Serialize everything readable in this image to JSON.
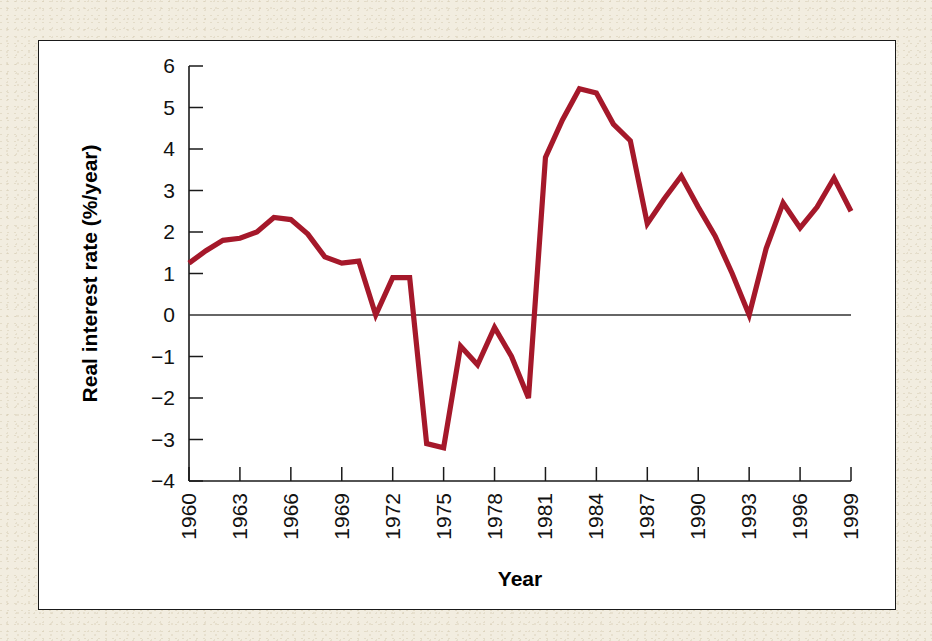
{
  "figure": {
    "page_background": "#F2EDE0",
    "panel_background": "#FFFFFF",
    "panel_border_color": "#1A1A1A"
  },
  "chart_data": {
    "type": "line",
    "title": "",
    "xlabel": "Year",
    "ylabel": "Real interest rate (%/year)",
    "xlim": [
      1960,
      1999
    ],
    "ylim": [
      -4,
      6
    ],
    "ytick_labels": [
      "6",
      "5",
      "4",
      "3",
      "2",
      "1",
      "0",
      "−1",
      "−2",
      "−3",
      "−4"
    ],
    "ytick_values": [
      6,
      5,
      4,
      3,
      2,
      1,
      0,
      -1,
      -2,
      -3,
      -4
    ],
    "xtick_labels": [
      "1960",
      "1963",
      "1966",
      "1969",
      "1972",
      "1975",
      "1978",
      "1981",
      "1984",
      "1987",
      "1990",
      "1993",
      "1996",
      "1999"
    ],
    "xtick_values": [
      1960,
      1963,
      1966,
      1969,
      1972,
      1975,
      1978,
      1981,
      1984,
      1987,
      1990,
      1993,
      1996,
      1999
    ],
    "grid": false,
    "legend": false,
    "zero_line": true,
    "series": [
      {
        "name": "Real interest rate",
        "color": "#A5182A",
        "x": [
          1960,
          1961,
          1962,
          1963,
          1964,
          1965,
          1966,
          1967,
          1968,
          1969,
          1970,
          1971,
          1972,
          1973,
          1974,
          1975,
          1976,
          1977,
          1978,
          1979,
          1980,
          1981,
          1982,
          1983,
          1984,
          1985,
          1986,
          1987,
          1988,
          1989,
          1990,
          1991,
          1992,
          1993,
          1994,
          1995,
          1996,
          1997,
          1998,
          1999
        ],
        "values": [
          1.25,
          1.55,
          1.8,
          1.85,
          2.0,
          2.35,
          2.3,
          1.95,
          1.4,
          1.25,
          1.3,
          0.0,
          0.9,
          0.9,
          -3.1,
          -3.2,
          -0.75,
          -1.2,
          -0.3,
          -1.0,
          -2.0,
          3.8,
          4.7,
          5.45,
          5.35,
          4.6,
          4.2,
          2.2,
          2.8,
          3.35,
          2.6,
          1.9,
          1.0,
          0.0,
          1.6,
          2.7,
          2.1,
          2.6,
          3.3,
          2.5
        ]
      }
    ]
  },
  "axis_titles": {
    "x": "Year",
    "y": "Real interest rate (%/year)"
  }
}
